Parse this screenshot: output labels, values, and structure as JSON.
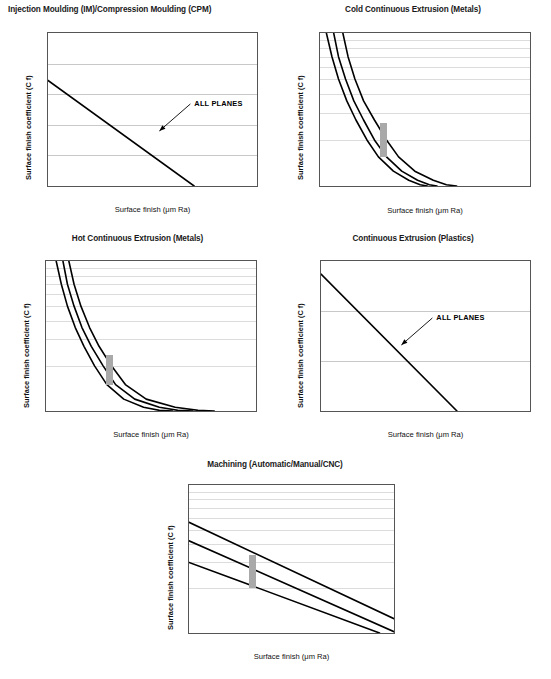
{
  "page": {
    "axis_labels": {
      "x": "Surface finish (μm Ra)",
      "y": "Surface finish coefficient (C f)"
    },
    "annotation_all_planes": "ALL PLANES"
  },
  "chart_data": [
    {
      "id": "injection-moulding",
      "type": "line",
      "title": "Injection Moulding (IM)/Compression Moulding (CPM)",
      "title_align": "left",
      "xlabel": "Surface finish (μm Ra)",
      "ylabel": "Surface finish coefficient (C f)",
      "xscale": "log",
      "yscale": "linear",
      "xlim": [
        0.1,
        1
      ],
      "ylim": [
        1,
        1.5
      ],
      "xticks": [
        "0.1",
        "1"
      ],
      "yticks": [
        "1",
        "1.1",
        "1.2",
        "1.3",
        "1.4",
        "1.5"
      ],
      "grid": true,
      "annotations": [
        {
          "text": "ALL PLANES",
          "x": 0.33,
          "y": 1.17
        }
      ],
      "series": [
        {
          "name": "ALL PLANES",
          "points": [
            [
              0.1,
              1.345
            ],
            [
              0.5,
              1.0
            ]
          ]
        }
      ]
    },
    {
      "id": "cold-continuous-extrusion",
      "type": "line",
      "title": "Cold Continuous Extrusion (Metals)",
      "title_align": "center",
      "xlabel": "Surface finish (μm Ra)",
      "ylabel": "Surface finish coefficient (C f)",
      "xscale": "log",
      "yscale": "log",
      "xlim": [
        0.1,
        10
      ],
      "ylim": [
        1,
        10
      ],
      "xticks": [
        "0.1",
        "1",
        "10"
      ],
      "yticks": [
        "1",
        "10"
      ],
      "grid": true,
      "marker_box": {
        "x": 0.4,
        "y_from": 1.55,
        "y_to": 2.6
      },
      "series": [
        {
          "name": "curve-1",
          "points": [
            [
              0.115,
              10
            ],
            [
              0.13,
              7
            ],
            [
              0.15,
              5
            ],
            [
              0.18,
              3.6
            ],
            [
              0.22,
              2.7
            ],
            [
              0.28,
              2.0
            ],
            [
              0.36,
              1.55
            ],
            [
              0.5,
              1.25
            ],
            [
              0.7,
              1.09
            ],
            [
              0.9,
              1.02
            ],
            [
              1.05,
              1.0
            ]
          ]
        },
        {
          "name": "curve-2",
          "points": [
            [
              0.135,
              10
            ],
            [
              0.15,
              7
            ],
            [
              0.175,
              5
            ],
            [
              0.21,
              3.6
            ],
            [
              0.26,
              2.7
            ],
            [
              0.33,
              2.0
            ],
            [
              0.43,
              1.55
            ],
            [
              0.6,
              1.25
            ],
            [
              0.85,
              1.09
            ],
            [
              1.1,
              1.02
            ],
            [
              1.3,
              1.0
            ]
          ]
        },
        {
          "name": "curve-3",
          "points": [
            [
              0.165,
              10
            ],
            [
              0.185,
              7
            ],
            [
              0.215,
              5
            ],
            [
              0.26,
              3.6
            ],
            [
              0.33,
              2.7
            ],
            [
              0.43,
              2.0
            ],
            [
              0.56,
              1.55
            ],
            [
              0.8,
              1.25
            ],
            [
              1.2,
              1.09
            ],
            [
              1.6,
              1.02
            ],
            [
              2.0,
              1.0
            ]
          ]
        }
      ]
    },
    {
      "id": "hot-continuous-extrusion",
      "type": "line",
      "title": "Hot Continuous Extrusion (Metals)",
      "title_align": "center",
      "xlabel": "Surface finish (μm Ra)",
      "ylabel": "Surface finish coefficient (C f)",
      "xscale": "log",
      "yscale": "log",
      "xlim": [
        0.1,
        10
      ],
      "ylim": [
        1,
        10
      ],
      "xticks": [
        "0.1",
        "1",
        "10"
      ],
      "yticks": [
        "1",
        "10"
      ],
      "grid": true,
      "marker_box": {
        "x": 0.4,
        "y_from": 1.5,
        "y_to": 2.35
      },
      "series": [
        {
          "name": "curve-1",
          "points": [
            [
              0.125,
              10
            ],
            [
              0.14,
              7
            ],
            [
              0.16,
              5
            ],
            [
              0.19,
              3.6
            ],
            [
              0.23,
              2.7
            ],
            [
              0.29,
              2.0
            ],
            [
              0.38,
              1.5
            ],
            [
              0.55,
              1.2
            ],
            [
              0.85,
              1.06
            ],
            [
              1.2,
              1.01
            ],
            [
              1.6,
              1.0
            ]
          ]
        },
        {
          "name": "curve-2",
          "points": [
            [
              0.145,
              10
            ],
            [
              0.16,
              7
            ],
            [
              0.185,
              5
            ],
            [
              0.22,
              3.6
            ],
            [
              0.27,
              2.7
            ],
            [
              0.35,
              2.0
            ],
            [
              0.46,
              1.5
            ],
            [
              0.7,
              1.2
            ],
            [
              1.2,
              1.06
            ],
            [
              1.8,
              1.01
            ],
            [
              2.5,
              1.0
            ]
          ]
        },
        {
          "name": "curve-3",
          "points": [
            [
              0.165,
              10
            ],
            [
              0.185,
              7
            ],
            [
              0.215,
              5
            ],
            [
              0.26,
              3.6
            ],
            [
              0.32,
              2.7
            ],
            [
              0.42,
              2.0
            ],
            [
              0.57,
              1.5
            ],
            [
              0.9,
              1.2
            ],
            [
              1.7,
              1.06
            ],
            [
              2.8,
              1.01
            ],
            [
              4.0,
              1.0
            ]
          ]
        }
      ]
    },
    {
      "id": "continuous-extrusion-plastics",
      "type": "line",
      "title": "Continuous Extrusion (Plastics)",
      "title_align": "center",
      "xlabel": "Surface finish (μm Ra)",
      "ylabel": "Surface finish coefficient (C f)",
      "xscale": "log",
      "yscale": "linear",
      "xlim": [
        0.1,
        10
      ],
      "ylim": [
        1,
        2.5
      ],
      "xticks": [
        "0.1",
        "1",
        "10"
      ],
      "yticks": [
        "1",
        "1.5",
        "2",
        "2.5"
      ],
      "grid": true,
      "annotations": [
        {
          "text": "ALL PLANES",
          "x": 0.55,
          "y": 1.63
        }
      ],
      "series": [
        {
          "name": "ALL PLANES",
          "points": [
            [
              0.1,
              2.37
            ],
            [
              2.0,
              1.0
            ]
          ]
        }
      ]
    },
    {
      "id": "machining",
      "type": "line",
      "title": "Machining (Automatic/Manual/CNC)",
      "title_align": "center",
      "xlabel": "Surface finish (μm Ra)",
      "ylabel": "Surface finish coefficient (C f)",
      "xscale": "log",
      "yscale": "log",
      "xlim": [
        0.1,
        1
      ],
      "ylim": [
        1,
        10
      ],
      "xticks": [
        "0.1",
        "1"
      ],
      "yticks": [
        "1",
        "10"
      ],
      "grid": true,
      "marker_box": {
        "x": 0.205,
        "y_from": 2.0,
        "y_to": 3.35
      },
      "series": [
        {
          "name": "curve-1",
          "points": [
            [
              0.1,
              5.6
            ],
            [
              1.0,
              1.25
            ]
          ]
        },
        {
          "name": "curve-2",
          "points": [
            [
              0.1,
              4.2
            ],
            [
              1.0,
              1.02
            ]
          ]
        },
        {
          "name": "curve-3",
          "points": [
            [
              0.1,
              3.0
            ],
            [
              0.85,
              1.0
            ]
          ]
        }
      ]
    }
  ]
}
